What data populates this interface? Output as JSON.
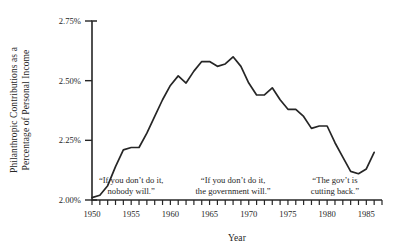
{
  "chart_data": {
    "type": "line",
    "title": "",
    "xlabel": "Year",
    "ylabel": "Philanthropic Contributions as a Percentage of Personal Income",
    "ylabel_line1": "Philanthropic Contributions as a",
    "ylabel_line2": "Percentage of Personal Income",
    "xlim": [
      1950,
      1987
    ],
    "ylim": [
      2.0,
      2.75
    ],
    "grid": false,
    "legend": null,
    "line_color": "#262626",
    "xticks": [
      1950,
      1951,
      1952,
      1953,
      1954,
      1955,
      1956,
      1957,
      1958,
      1959,
      1960,
      1961,
      1962,
      1963,
      1964,
      1965,
      1966,
      1967,
      1968,
      1969,
      1970,
      1971,
      1972,
      1973,
      1974,
      1975,
      1976,
      1977,
      1978,
      1979,
      1980,
      1981,
      1982,
      1983,
      1984,
      1985,
      1986,
      1987
    ],
    "xtick_labels": [
      "1950",
      "1955",
      "1960",
      "1965",
      "1970",
      "1975",
      "1980",
      "1985"
    ],
    "xtick_label_values": [
      1950,
      1955,
      1960,
      1965,
      1970,
      1975,
      1980,
      1985
    ],
    "yticks": [
      2.0,
      2.25,
      2.5,
      2.75
    ],
    "ytick_labels": [
      "2.00%",
      "2.25%",
      "2.50%",
      "2.75%"
    ],
    "x": [
      1950,
      1951,
      1952,
      1953,
      1954,
      1955,
      1956,
      1957,
      1958,
      1959,
      1960,
      1961,
      1962,
      1963,
      1964,
      1965,
      1966,
      1967,
      1968,
      1969,
      1970,
      1971,
      1972,
      1973,
      1974,
      1975,
      1976,
      1977,
      1978,
      1979,
      1980,
      1981,
      1982,
      1983,
      1984,
      1985,
      1986
    ],
    "values": [
      2.01,
      2.02,
      2.06,
      2.14,
      2.21,
      2.22,
      2.22,
      2.28,
      2.35,
      2.42,
      2.48,
      2.52,
      2.49,
      2.54,
      2.58,
      2.58,
      2.56,
      2.57,
      2.6,
      2.56,
      2.49,
      2.44,
      2.44,
      2.47,
      2.42,
      2.38,
      2.38,
      2.35,
      2.3,
      2.31,
      2.31,
      2.24,
      2.18,
      2.12,
      2.11,
      2.13,
      2.2
    ],
    "series_note": "Philanthropic contributions as a percentage of personal income, 1950-1986",
    "annotations": [
      {
        "text_line1": "“If you don’t do it,",
        "text_line2": "nobody will.”",
        "x_year": 1955,
        "y_value": 2.07
      },
      {
        "text_line1": "“If you don’t do it,",
        "text_line2": "the government will.”",
        "x_year": 1968,
        "y_value": 2.07
      },
      {
        "text_line1": "“The gov’t is",
        "text_line2": "cutting back.”",
        "x_year": 1981,
        "y_value": 2.07
      }
    ]
  }
}
